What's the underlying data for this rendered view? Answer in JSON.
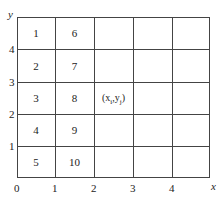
{
  "diagram": {
    "axes": {
      "x_label": "x",
      "y_label": "y",
      "origin": "0",
      "x_ticks": [
        "1",
        "2",
        "3",
        "4"
      ],
      "y_ticks": [
        "1",
        "2",
        "3",
        "4"
      ]
    },
    "grid": {
      "columns": 5,
      "rows": 5,
      "line_color": "#444444"
    },
    "cells": [
      {
        "row": 0,
        "col": 0,
        "label": "1"
      },
      {
        "row": 1,
        "col": 0,
        "label": "2"
      },
      {
        "row": 2,
        "col": 0,
        "label": "3"
      },
      {
        "row": 3,
        "col": 0,
        "label": "4"
      },
      {
        "row": 4,
        "col": 0,
        "label": "5"
      },
      {
        "row": 0,
        "col": 1,
        "label": "6"
      },
      {
        "row": 1,
        "col": 1,
        "label": "7"
      },
      {
        "row": 2,
        "col": 1,
        "label": "8"
      },
      {
        "row": 3,
        "col": 1,
        "label": "9"
      },
      {
        "row": 4,
        "col": 1,
        "label": "10"
      },
      {
        "row": 2,
        "col": 2,
        "label": "(x_i, y_j)"
      }
    ],
    "special_cell": {
      "base": "(x",
      "sub1": "i",
      "mid": ",y",
      "sub2": "j",
      "end": ")"
    }
  }
}
